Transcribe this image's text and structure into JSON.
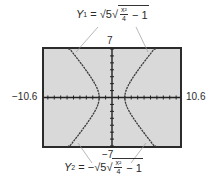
{
  "chart_data": {
    "type": "line",
    "title": "",
    "window": {
      "xmin": -10.6,
      "xmax": 10.6,
      "ymin": -7,
      "ymax": 7
    },
    "tick_labels": {
      "xmin": "−10.6",
      "xmax": "10.6",
      "ymax": "7",
      "ymin": "−7"
    },
    "grid": false,
    "axes_ticks": true,
    "series": [
      {
        "name": "Y1 = √5·√(x²/4 − 1)",
        "label_prefix": "Y",
        "label_sub": "1",
        "sign": "",
        "points_note": "upper branches of hyperbola x²/4 − y²/5 = 1",
        "x": [
          -10.6,
          -8,
          -6,
          -4,
          -3,
          -2,
          2,
          3,
          4,
          6,
          8,
          10.6
        ],
        "y": [
          11.6,
          8.66,
          6.32,
          3.87,
          2.5,
          0,
          0,
          2.5,
          3.87,
          6.32,
          8.66,
          11.6
        ]
      },
      {
        "name": "Y2 = −√5·√(x²/4 − 1)",
        "label_prefix": "Y",
        "label_sub": "2",
        "sign": "−",
        "points_note": "lower branches of hyperbola x²/4 − y²/5 = 1",
        "x": [
          -10.6,
          -8,
          -6,
          -4,
          -3,
          -2,
          2,
          3,
          4,
          6,
          8,
          10.6
        ],
        "y": [
          -11.6,
          -8.66,
          -6.32,
          -3.87,
          -2.5,
          0,
          0,
          -2.5,
          -3.87,
          -6.32,
          -8.66,
          -11.6
        ]
      }
    ],
    "colors": {
      "screen_bg": "#d9d9d9",
      "frame": "#2b2b2b",
      "curve": "#3a3a3a",
      "callout_line": "#9a9a9a"
    }
  },
  "equations": {
    "y1": {
      "prefix": "Y",
      "sub": "1",
      "equals": " = ",
      "sign": "",
      "coef": "√5",
      "num": "x²",
      "den": "4",
      "tail": " − 1"
    },
    "y2": {
      "prefix": "Y",
      "sub": "2",
      "equals": " = ",
      "sign": "−",
      "coef": "√5",
      "num": "x²",
      "den": "4",
      "tail": " − 1"
    }
  }
}
